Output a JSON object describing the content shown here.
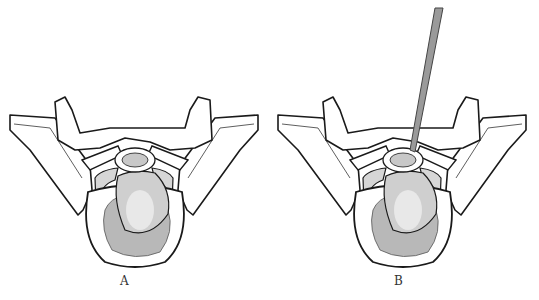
{
  "caption_top": "",
  "panels": [
    {
      "id": "A",
      "label": "A",
      "instrument": false
    },
    {
      "id": "B",
      "label": "B",
      "instrument": true
    }
  ],
  "colors": {
    "outline": "#1a1a1a",
    "bone_fill": "#ffffff",
    "tumor_fill": "#b8b8b8",
    "tumor_highlight": "#eeeeee",
    "instrument": "#9a9a9a"
  }
}
